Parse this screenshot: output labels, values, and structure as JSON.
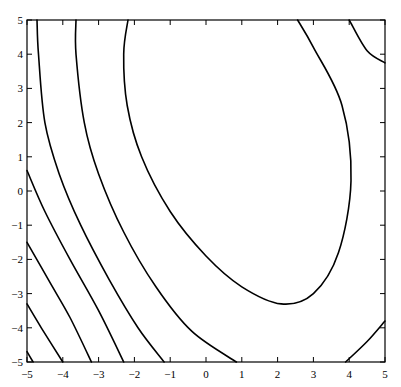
{
  "chart_data": {
    "type": "contour",
    "title": "",
    "xlabel": "",
    "ylabel": "",
    "xlim": [
      -5,
      5
    ],
    "ylim": [
      -5,
      5
    ],
    "grid": false,
    "legend": null,
    "x_ticks": [
      -5,
      -4,
      -3,
      -2,
      -1,
      0,
      1,
      2,
      3,
      4,
      5
    ],
    "y_ticks": [
      -5,
      -4,
      -3,
      -2,
      -1,
      0,
      1,
      2,
      3,
      4,
      5
    ],
    "x_tick_labels": [
      "−5",
      "−4",
      "−3",
      "−2",
      "−1",
      "0",
      "1",
      "2",
      "3",
      "4",
      "5"
    ],
    "y_tick_labels": [
      "−5",
      "−4",
      "−3",
      "−2",
      "−1",
      "0",
      "1",
      "2",
      "3",
      "4",
      "5"
    ],
    "line_color": "#000000",
    "contours": [
      {
        "name": "level-1",
        "points": [
          [
            -5,
            -4.7
          ],
          [
            -4.83,
            -5
          ]
        ]
      },
      {
        "name": "level-2",
        "points": [
          [
            -5,
            -3.3
          ],
          [
            -4.6,
            -4.0
          ],
          [
            -4.0,
            -5
          ]
        ]
      },
      {
        "name": "level-3",
        "points": [
          [
            -5,
            -1.5
          ],
          [
            -4.4,
            -2.6
          ],
          [
            -3.8,
            -3.7
          ],
          [
            -3.2,
            -5
          ]
        ]
      },
      {
        "name": "level-4",
        "points": [
          [
            -5,
            0.6
          ],
          [
            -4.5,
            -0.6
          ],
          [
            -3.8,
            -2.0
          ],
          [
            -3.0,
            -3.5
          ],
          [
            -2.3,
            -5
          ]
        ]
      },
      {
        "name": "level-5",
        "points": [
          [
            -4.72,
            5
          ],
          [
            -4.68,
            4.0
          ],
          [
            -4.5,
            2.0
          ],
          [
            -4.1,
            0.5
          ],
          [
            -3.5,
            -1.0
          ],
          [
            -2.7,
            -2.6
          ],
          [
            -1.9,
            -4.0
          ],
          [
            -1.17,
            -5
          ]
        ]
      },
      {
        "name": "level-6",
        "points": [
          [
            -3.63,
            5
          ],
          [
            -3.63,
            4.0
          ],
          [
            -3.4,
            2.0
          ],
          [
            -3.0,
            0.5
          ],
          [
            -2.3,
            -1.2
          ],
          [
            -1.4,
            -2.8
          ],
          [
            -0.4,
            -4.1
          ],
          [
            0.85,
            -5
          ]
        ]
      },
      {
        "name": "level-7-ellipse",
        "points": [
          [
            -2.18,
            5
          ],
          [
            -2.3,
            4.0
          ],
          [
            -2.2,
            2.5
          ],
          [
            -1.8,
            1.0
          ],
          [
            -1.0,
            -0.6
          ],
          [
            0.0,
            -1.9
          ],
          [
            1.0,
            -2.8
          ],
          [
            2.1,
            -3.3
          ],
          [
            3.0,
            -3.0
          ],
          [
            3.7,
            -1.8
          ],
          [
            4.05,
            0.3
          ],
          [
            3.8,
            2.5
          ],
          [
            3.0,
            4.2
          ],
          [
            2.56,
            5
          ]
        ]
      },
      {
        "name": "level-6-right-top",
        "points": [
          [
            4.0,
            5
          ],
          [
            4.5,
            4.1
          ],
          [
            5.0,
            3.75
          ]
        ]
      },
      {
        "name": "level-6-right-bottom",
        "points": [
          [
            3.9,
            -5
          ],
          [
            4.5,
            -4.4
          ],
          [
            5.0,
            -3.8
          ]
        ]
      }
    ]
  }
}
